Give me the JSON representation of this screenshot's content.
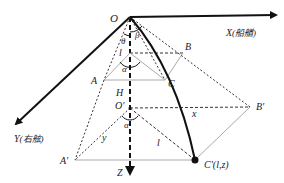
{
  "diagram": {
    "type": "3D coordinate geometry (cable/towing configuration)",
    "colors": {
      "stroke": "#111111",
      "dashed": "#333333",
      "light": "#aaaaaa",
      "background": "#ffffff"
    },
    "axes": {
      "x": {
        "label": "X(船艏)",
        "var": "X",
        "note": "船艏"
      },
      "y": {
        "label": "Y(右舷)",
        "var": "Y",
        "note": "右舷"
      },
      "z": {
        "label": "Z"
      }
    },
    "points": {
      "O": "O",
      "A": "A",
      "B": "B",
      "C": "C",
      "H": "H",
      "O_prime": "O'",
      "A_prime": "A'",
      "B_prime": "B'",
      "C_prime": "C'(l,z)"
    },
    "angles": {
      "beta": "β",
      "theta": "θ",
      "alpha_upper": "α",
      "alpha_lower": "α"
    },
    "segments": {
      "l_upper": "l",
      "l_lower": "l",
      "x": "x",
      "y": "y"
    }
  }
}
